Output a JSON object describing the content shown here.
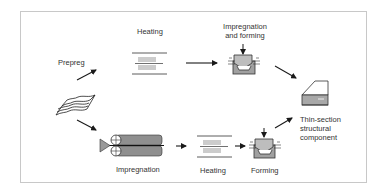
{
  "diagram": {
    "labels": {
      "prepreg": "Prepreg",
      "heating_top": "Heating",
      "impregnation_and_forming_line1": "Impregnation",
      "impregnation_and_forming_line2": "and forming",
      "impregnation_bottom": "Impregnation",
      "heating_bottom": "Heating",
      "forming": "Forming",
      "component_line1": "Thin-section",
      "component_line2": "structural",
      "component_line3": "component"
    },
    "nodes": [
      {
        "id": "fabric-stack",
        "icon": "fabric-stack-icon"
      },
      {
        "id": "heating-top",
        "icon": "heater-icon"
      },
      {
        "id": "impregnation-forming",
        "icon": "press-mold-icon"
      },
      {
        "id": "impregnation-rollers",
        "icon": "roller-impregnation-icon"
      },
      {
        "id": "heating-bottom",
        "icon": "heater-icon"
      },
      {
        "id": "forming",
        "icon": "press-mold-icon"
      },
      {
        "id": "component",
        "icon": "component-icon"
      }
    ],
    "edges": [
      {
        "from": "fabric-stack",
        "to": "heating-top",
        "label": "Prepreg"
      },
      {
        "from": "heating-top",
        "to": "impregnation-forming"
      },
      {
        "from": "impregnation-forming",
        "to": "component"
      },
      {
        "from": "fabric-stack",
        "to": "impregnation-rollers"
      },
      {
        "from": "impregnation-rollers",
        "to": "heating-bottom"
      },
      {
        "from": "heating-bottom",
        "to": "forming"
      },
      {
        "from": "forming",
        "to": "component"
      }
    ],
    "colors": {
      "line": "#1a1a1a",
      "fill_dark": "#8a8a8a",
      "fill_mid": "#a8a8a8",
      "fill_light": "#d0d0d0",
      "frame": "#c8c8c8"
    }
  }
}
